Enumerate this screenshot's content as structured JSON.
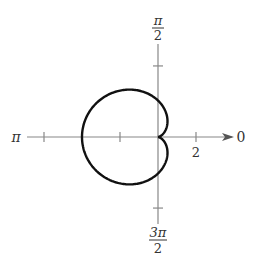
{
  "chart_data": {
    "type": "line",
    "coordinate_system": "polar",
    "equation": "r = 2(1 - cos θ)",
    "series": [
      {
        "name": "cardioid",
        "a": 2,
        "b": -2,
        "theta_range": [
          0,
          6.2832
        ],
        "samples": 360
      }
    ],
    "polar_axis_label": "0",
    "angle_labels": {
      "zero": "0",
      "half_pi_num": "π",
      "half_pi_den": "2",
      "pi": "π",
      "three_half_pi_num": "3π",
      "three_half_pi_den": "2"
    },
    "radial_ticks": [
      -6,
      -2,
      2
    ],
    "vertical_ticks": [
      4,
      -4
    ],
    "tick_labels": [
      {
        "value": 2,
        "text": "2"
      }
    ],
    "r_range": [
      -7,
      4
    ],
    "grid": false,
    "title": "",
    "colors": {
      "curve": "#111111",
      "axis": "#888888",
      "text": "#333333"
    }
  }
}
